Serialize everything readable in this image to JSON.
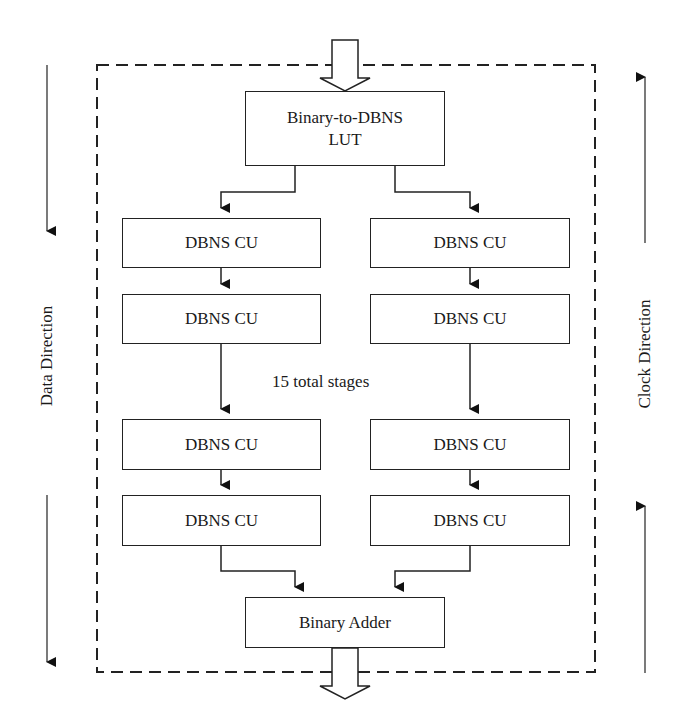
{
  "diagram": {
    "lut": {
      "line1": "Binary-to-DBNS",
      "line2": "LUT"
    },
    "left_column": [
      {
        "label": "DBNS CU"
      },
      {
        "label": "DBNS CU"
      },
      {
        "label": "DBNS CU"
      },
      {
        "label": "DBNS CU"
      }
    ],
    "right_column": [
      {
        "label": "DBNS CU"
      },
      {
        "label": "DBNS CU"
      },
      {
        "label": "DBNS CU"
      },
      {
        "label": "DBNS CU"
      }
    ],
    "stages_note": "15 total stages",
    "adder": {
      "label": "Binary Adder"
    },
    "left_axis_label": "Data Direction",
    "right_axis_label": "Clock Direction",
    "colors": {
      "stroke": "#222222",
      "background": "#ffffff"
    }
  }
}
